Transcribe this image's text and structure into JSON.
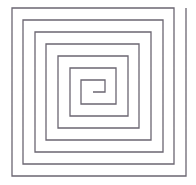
{
  "diagram": {
    "type": "square-spiral",
    "stroke_color": "#6b6672",
    "stroke_width": 1.3,
    "background": "#ffffff",
    "points": [
      [
        93,
        92
      ],
      [
        105,
        92
      ],
      [
        105,
        80
      ],
      [
        81,
        80
      ],
      [
        81,
        104
      ],
      [
        116,
        104
      ],
      [
        116,
        68
      ],
      [
        70,
        68
      ],
      [
        70,
        116
      ],
      [
        128,
        116
      ],
      [
        128,
        56
      ],
      [
        58,
        56
      ],
      [
        58,
        128
      ],
      [
        139,
        128
      ],
      [
        139,
        44
      ],
      [
        46,
        44
      ],
      [
        46,
        140
      ],
      [
        151,
        140
      ],
      [
        151,
        32
      ],
      [
        35,
        32
      ],
      [
        35,
        152
      ],
      [
        163,
        152
      ],
      [
        163,
        20
      ],
      [
        23,
        20
      ],
      [
        23,
        164
      ],
      [
        174,
        164
      ],
      [
        174,
        8
      ],
      [
        12,
        8
      ],
      [
        12,
        176
      ],
      [
        186,
        176
      ],
      [
        186,
        8
      ]
    ]
  }
}
